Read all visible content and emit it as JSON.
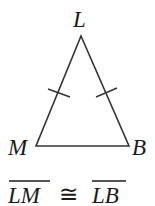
{
  "diagram": {
    "type": "isosceles-triangle",
    "vertices": [
      {
        "label": "L",
        "x": 81,
        "y": 36
      },
      {
        "label": "M",
        "x": 36,
        "y": 146
      },
      {
        "label": "B",
        "x": 129,
        "y": 146
      }
    ],
    "congruence_marks": [
      "LM",
      "LB"
    ],
    "statement": {
      "left": "LM",
      "symbol": "≅",
      "right": "LB"
    },
    "colors": {
      "stroke": "#333333",
      "text": "#1a1a1a"
    }
  }
}
